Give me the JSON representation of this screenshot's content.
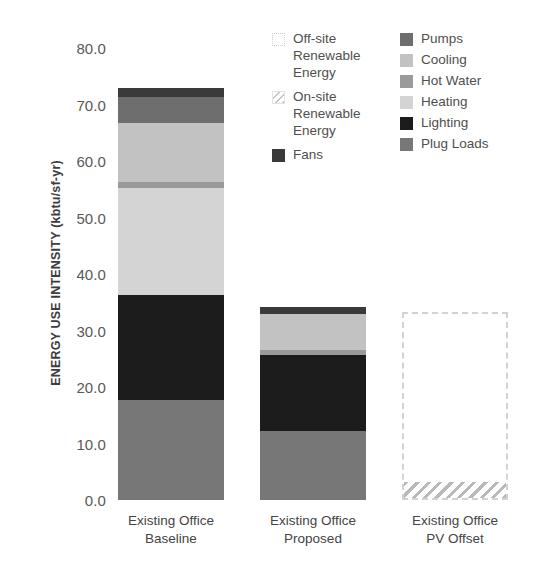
{
  "chart_data": {
    "type": "bar",
    "subtype": "stacked-bar",
    "title": "",
    "xlabel": "",
    "ylabel": "ENERGY USE INTENSITY (kbtu/sf-yr)",
    "ylim": [
      0,
      80
    ],
    "ytick_step": 10,
    "ytick_labels": [
      "80.0",
      "70.0",
      "60.0",
      "50.0",
      "40.0",
      "30.0",
      "20.0",
      "10.0",
      "0.0"
    ],
    "ytick_values": [
      80,
      70,
      60,
      50,
      40,
      30,
      20,
      10,
      0
    ],
    "grid": false,
    "legend_position": "top-right",
    "categories": [
      "Existing Office Baseline",
      "Existing Office Proposed",
      "Existing Office PV Offset"
    ],
    "category_lines": [
      [
        "Existing Office",
        "Baseline"
      ],
      [
        "Existing Office",
        "Proposed"
      ],
      [
        "Existing Office",
        "PV Offset"
      ]
    ],
    "series": [
      {
        "name": "Plug Loads",
        "color": "#777777",
        "values": [
          17.7,
          12.3,
          0
        ]
      },
      {
        "name": "Lighting",
        "color": "#1c1c1c",
        "values": [
          18.6,
          13.4,
          0
        ]
      },
      {
        "name": "Heating",
        "color": "#d4d4d4",
        "values": [
          18.9,
          0,
          0
        ]
      },
      {
        "name": "Hot Water",
        "color": "#9a9a9a",
        "values": [
          1.1,
          0.9,
          0
        ]
      },
      {
        "name": "Cooling",
        "color": "#c2c2c2",
        "values": [
          10.4,
          6.3,
          0
        ]
      },
      {
        "name": "Pumps",
        "color": "#6e6e6e",
        "values": [
          4.6,
          0,
          0
        ]
      },
      {
        "name": "Fans",
        "color": "#3a3a3a",
        "values": [
          1.6,
          1.3,
          0
        ]
      },
      {
        "name": "On-site Renewable Energy",
        "color": "#b9b9b9",
        "fill": "hatch",
        "values": [
          0,
          0,
          2.9
        ]
      },
      {
        "name": "Off-site Renewable Energy",
        "color": "#ffffff",
        "fill": "dotted",
        "values": [
          0,
          0,
          30.4
        ]
      }
    ],
    "totals": [
      70.7,
      33.3,
      33.3
    ]
  },
  "legend": {
    "left_column": [
      {
        "label": "Off-site\nRenewable\nEnergy",
        "swatch": "dotted-outline-swatch"
      },
      {
        "label": "On-site\nRenewable\nEnergy",
        "swatch": "hatched-swatch"
      },
      {
        "label": "Fans",
        "swatch": "fans-swatch",
        "color": "#3a3a3a"
      }
    ],
    "right_column": [
      {
        "label": "Pumps",
        "swatch": "pumps-swatch",
        "color": "#6e6e6e"
      },
      {
        "label": "Cooling",
        "swatch": "cooling-swatch",
        "color": "#c2c2c2"
      },
      {
        "label": "Hot Water",
        "swatch": "hot-water-swatch",
        "color": "#9a9a9a"
      },
      {
        "label": "Heating",
        "swatch": "heating-swatch",
        "color": "#d4d4d4"
      },
      {
        "label": "Lighting",
        "swatch": "lighting-swatch",
        "color": "#1c1c1c"
      },
      {
        "label": "Plug Loads",
        "swatch": "plug-loads-swatch",
        "color": "#777777"
      }
    ]
  },
  "axis": {
    "y_title_main": "ENERGY USE INTENSITY",
    "y_title_unit": " (kbtu/sf-yr)"
  }
}
